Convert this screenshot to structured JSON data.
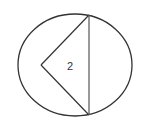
{
  "diagram": {
    "type": "geometry",
    "colors": {
      "stroke": "#333333",
      "chord": "#555555",
      "background": "#ffffff"
    },
    "circle": {
      "cx": 75,
      "cy": 65,
      "rx": 57,
      "ry": 51
    },
    "triangle": {
      "apex": {
        "x": 41,
        "y": 65
      },
      "chord_top": {
        "x": 89,
        "y": 15
      },
      "chord_bottom": {
        "x": 89,
        "y": 115
      }
    },
    "label": {
      "text": "2",
      "x": 70,
      "y": 70
    }
  }
}
